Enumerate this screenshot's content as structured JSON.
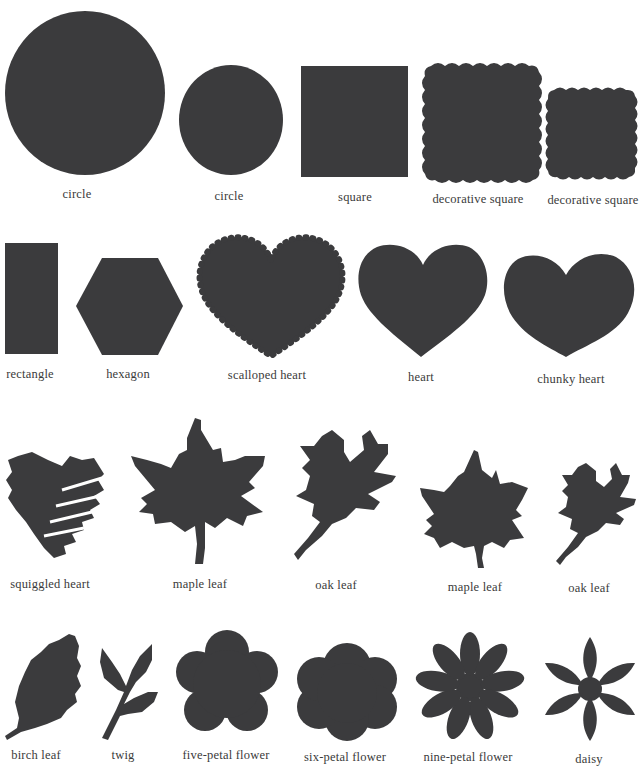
{
  "page": {
    "background": "#ffffff",
    "shape_color": "#3b3b3d",
    "text_color": "#3a3a3a"
  },
  "rows": [
    {
      "items": [
        {
          "id": "circle-large",
          "label": "circle"
        },
        {
          "id": "circle-small",
          "label": "circle"
        },
        {
          "id": "square",
          "label": "square"
        },
        {
          "id": "decorative-square-large",
          "label": "decorative square"
        },
        {
          "id": "decorative-square-small",
          "label": "decorative square"
        }
      ]
    },
    {
      "items": [
        {
          "id": "rectangle",
          "label": "rectangle"
        },
        {
          "id": "hexagon",
          "label": "hexagon"
        },
        {
          "id": "scalloped-heart",
          "label": "scalloped heart"
        },
        {
          "id": "heart",
          "label": "heart"
        },
        {
          "id": "chunky-heart",
          "label": "chunky heart"
        }
      ]
    },
    {
      "items": [
        {
          "id": "squiggled-heart",
          "label": "squiggled heart"
        },
        {
          "id": "maple-leaf-large",
          "label": "maple leaf"
        },
        {
          "id": "oak-leaf-large",
          "label": "oak leaf"
        },
        {
          "id": "maple-leaf-small",
          "label": "maple leaf"
        },
        {
          "id": "oak-leaf-small",
          "label": "oak leaf"
        }
      ]
    },
    {
      "items": [
        {
          "id": "birch-leaf",
          "label": "birch leaf"
        },
        {
          "id": "twig",
          "label": "twig"
        },
        {
          "id": "five-petal-flower",
          "label": "five-petal flower"
        },
        {
          "id": "six-petal-flower",
          "label": "six-petal flower"
        },
        {
          "id": "nine-petal-flower",
          "label": "nine-petal flower"
        },
        {
          "id": "daisy",
          "label": "daisy"
        }
      ]
    }
  ]
}
